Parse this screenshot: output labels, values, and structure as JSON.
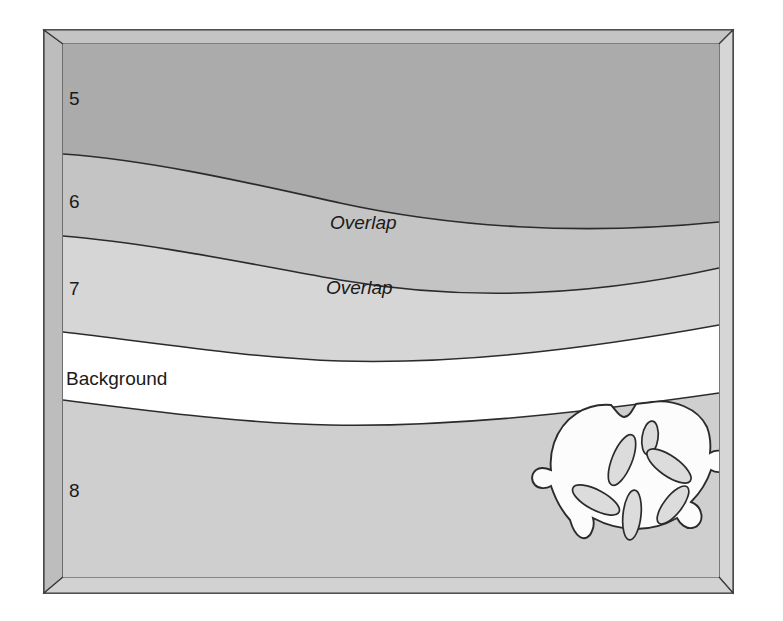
{
  "figure": {
    "type": "stratigraphic-cross-section-block-diagram",
    "frame": {
      "bevel_color": "#C9C9C9",
      "bevel_shadow_color": "#A8A8A8",
      "outline_color": "#2b2b2b"
    },
    "labels": {
      "layer_5": "5",
      "layer_6": "6",
      "layer_7": "7",
      "layer_8": "8",
      "background": "Background",
      "overlap_upper": "Overlap",
      "overlap_lower": "Overlap"
    },
    "bands": [
      {
        "name": "layer-5",
        "label": "5",
        "color": "#ABABAB"
      },
      {
        "name": "layer-6",
        "label": "6",
        "color": "#C4C4C4"
      },
      {
        "name": "layer-7",
        "label": "7",
        "color": "#D6D6D6"
      },
      {
        "name": "background-band",
        "label": "Background",
        "color": "#FFFFFF"
      },
      {
        "name": "layer-8",
        "label": "8",
        "color": "#CFCFCF"
      }
    ],
    "artifact": {
      "name": "sand-dollar",
      "fill": "#FCFCFC",
      "petal_fill": "#DCDCDC",
      "petal_count": 6
    }
  }
}
